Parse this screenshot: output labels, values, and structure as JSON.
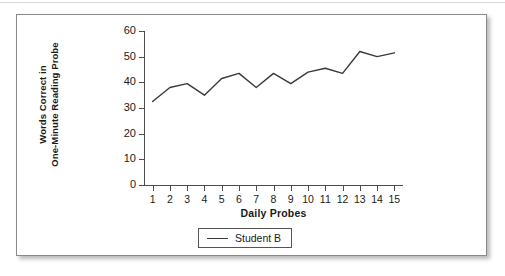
{
  "figure": {
    "border_color": "#8a8a8a",
    "background": "#ffffff"
  },
  "chart_data": {
    "type": "line",
    "title": "",
    "xlabel": "Daily Probes",
    "ylabel": "Words Correct in One-Minute Reading Probe",
    "ylabel_line1": "Words Correct in",
    "ylabel_line2": "One-Minute Reading Probe",
    "categories": [
      "1",
      "2",
      "3",
      "4",
      "5",
      "6",
      "7",
      "8",
      "9",
      "10",
      "11",
      "12",
      "13",
      "14",
      "15"
    ],
    "x": [
      1,
      2,
      3,
      4,
      5,
      6,
      7,
      8,
      9,
      10,
      11,
      12,
      13,
      14,
      15
    ],
    "series": [
      {
        "name": "Student B",
        "color": "#3a3a3a",
        "values": [
          32.5,
          38,
          39.5,
          35,
          41.5,
          43.5,
          38,
          43.5,
          39.5,
          44,
          45.5,
          43.5,
          52,
          50,
          51.5
        ]
      }
    ],
    "ylim": [
      0,
      60
    ],
    "yticks": [
      0,
      10,
      20,
      30,
      40,
      50,
      60
    ],
    "ytick_labels": [
      "0",
      "10",
      "20",
      "30",
      "40",
      "50",
      "60"
    ],
    "xlim": [
      0.5,
      15.5
    ],
    "grid": false,
    "legend_position": "bottom-center",
    "legend_entries": [
      "Student B"
    ]
  }
}
